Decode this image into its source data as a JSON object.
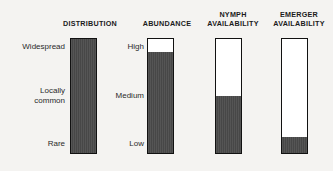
{
  "figure": {
    "background_color": "#f4f3f1",
    "bar_border_color": "#111111",
    "bar_fill_color": "#4b4b4b",
    "bar_empty_color": "#ffffff"
  },
  "scale_labels": {
    "distribution": {
      "top": "Widespread",
      "middle": "Locally\ncommon",
      "bottom": "Rare"
    },
    "abundance": {
      "top": "High",
      "middle": "Medium",
      "bottom": "Low"
    }
  },
  "columns": [
    {
      "id": "distribution",
      "header": "DISTRIBUTION",
      "fill_percent": 100
    },
    {
      "id": "abundance",
      "header": "ABUNDANCE",
      "fill_percent": 89
    },
    {
      "id": "nymph-availability",
      "header": "NYMPH\nAVAILABILITY",
      "fill_percent": 50
    },
    {
      "id": "emerger-availability",
      "header": "EMERGER\nAVAILABILITY",
      "fill_percent": 14
    }
  ],
  "chart_data": {
    "type": "bar",
    "title": "",
    "xlabel": "",
    "ylabel": "",
    "orientation": "vertical",
    "categories": [
      "DISTRIBUTION",
      "ABUNDANCE",
      "NYMPH AVAILABILITY",
      "EMERGER AVAILABILITY"
    ],
    "values": [
      100,
      89,
      50,
      14
    ],
    "ylim": [
      0,
      100
    ],
    "grid": false,
    "legend": "none",
    "value_unit": "percent of bar filled",
    "ytick_labels": {
      "distribution": [
        "Rare",
        "Locally common",
        "Widespread"
      ],
      "abundance": [
        "Low",
        "Medium",
        "High"
      ]
    },
    "ytick_positions": [
      0,
      50,
      100
    ]
  }
}
